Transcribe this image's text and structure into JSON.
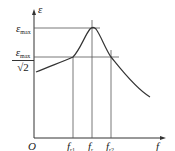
{
  "diagram": {
    "type": "resonance-curve",
    "y_axis_label": "ε",
    "x_axis_label": "f",
    "origin_label": "O",
    "y_marks": [
      {
        "main": "ε",
        "sub": "max"
      },
      {
        "main": "ε",
        "sub": "max",
        "denominator": "√2"
      }
    ],
    "x_marks": [
      {
        "main": "f",
        "sub": "r1"
      },
      {
        "main": "f",
        "sub": "r"
      },
      {
        "main": "f",
        "sub": "r2"
      }
    ]
  },
  "colors": {
    "line": "#333333",
    "guide": "#555555"
  }
}
